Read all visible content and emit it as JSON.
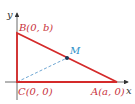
{
  "diagram": {
    "axes": {
      "x_label": "x",
      "y_label": "y"
    },
    "points": {
      "A": {
        "label": "A(a, 0)"
      },
      "B": {
        "label": "B(0, b)"
      },
      "C": {
        "label": "C(0, 0)"
      },
      "M": {
        "label": "M"
      }
    },
    "colors": {
      "triangle": "#d42a2a",
      "label_red": "#c8323c",
      "label_blue": "#2a8fc8",
      "median": "#4a90c8",
      "axis": "#333333"
    }
  }
}
